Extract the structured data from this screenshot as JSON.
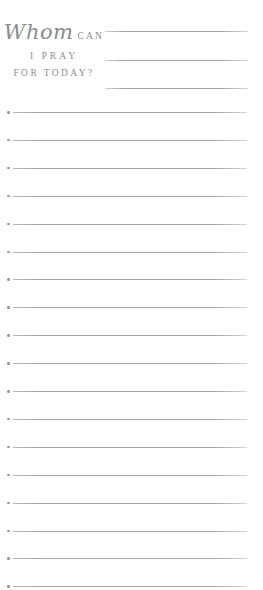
{
  "header": {
    "title_script": "Whom",
    "title_can": "CAN",
    "title_line2": "I PRAY",
    "title_line3": "FOR TODAY?",
    "write_line_count": 3
  },
  "list": {
    "row_count": 18,
    "bullet_icon": "dot",
    "entries": [
      "",
      "",
      "",
      "",
      "",
      "",
      "",
      "",
      "",
      "",
      "",
      "",
      "",
      "",
      "",
      "",
      "",
      ""
    ]
  },
  "colors": {
    "title_text": "#878f8e",
    "rule_line": "#a6a6a6",
    "background": "#ffffff"
  }
}
